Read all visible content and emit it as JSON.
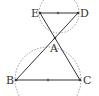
{
  "diagram": {
    "type": "geometry",
    "colors": {
      "line": "#333333",
      "dashed": "#888888",
      "label": "#333333",
      "background": "#ffffff"
    },
    "points": {
      "A": {
        "label": "A",
        "x": 55,
        "y": 38
      },
      "B": {
        "label": "B",
        "x": 16,
        "y": 80
      },
      "C": {
        "label": "C",
        "x": 80,
        "y": 80
      },
      "D": {
        "label": "D",
        "x": 78,
        "y": 13
      },
      "E": {
        "label": "E",
        "x": 40,
        "y": 13
      }
    },
    "segments": [
      {
        "from": "E",
        "to": "D"
      },
      {
        "from": "B",
        "to": "C"
      },
      {
        "from": "E",
        "to": "C"
      },
      {
        "from": "D",
        "to": "B"
      }
    ],
    "midpoints": [
      {
        "of": "ED",
        "x": 58,
        "y": 13
      },
      {
        "of": "BC",
        "x": 48,
        "y": 80
      }
    ],
    "circles": [
      {
        "name": "circle-ED",
        "cx": 59,
        "cy": 13,
        "r": 20,
        "style": "dashed"
      },
      {
        "name": "circle-BC",
        "cx": 48,
        "cy": 80,
        "r": 33,
        "style": "dashed"
      }
    ]
  }
}
